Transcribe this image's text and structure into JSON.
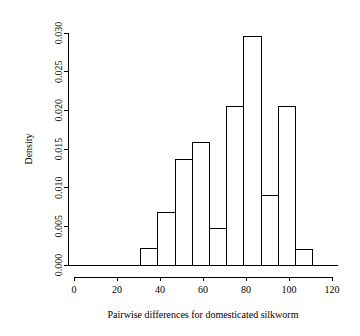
{
  "chart_data": {
    "type": "bar",
    "subtype": "histogram",
    "title": "",
    "xlabel": "Pairwise differences for domesticated silkworm",
    "ylabel": "Density",
    "xlim": [
      0,
      120
    ],
    "ylim": [
      0.0,
      0.03
    ],
    "grid": false,
    "legend": null,
    "bin_width": 8,
    "bin_edges": [
      31,
      39,
      47,
      55,
      63,
      71,
      79,
      87,
      95,
      103,
      111
    ],
    "categories": [
      "31-39",
      "39-47",
      "47-55",
      "55-63",
      "63-71",
      "71-79",
      "79-87",
      "87-95",
      "95-103",
      "103-111"
    ],
    "values": [
      0.0021,
      0.0068,
      0.0136,
      0.0159,
      0.0047,
      0.0205,
      0.0296,
      0.009,
      0.0205,
      0.002
    ],
    "bars": [
      {
        "x0": 31,
        "x1": 39,
        "density": 0.0021
      },
      {
        "x0": 39,
        "x1": 47,
        "density": 0.0068
      },
      {
        "x0": 47,
        "x1": 55,
        "density": 0.0136
      },
      {
        "x0": 55,
        "x1": 63,
        "density": 0.0159
      },
      {
        "x0": 63,
        "x1": 71,
        "density": 0.0047
      },
      {
        "x0": 71,
        "x1": 79,
        "density": 0.0205
      },
      {
        "x0": 79,
        "x1": 87,
        "density": 0.0296
      },
      {
        "x0": 87,
        "x1": 95,
        "density": 0.009
      },
      {
        "x0": 95,
        "x1": 103,
        "density": 0.0205
      },
      {
        "x0": 103,
        "x1": 111,
        "density": 0.002
      }
    ],
    "xticks": [
      0,
      20,
      40,
      60,
      80,
      100,
      120
    ],
    "xticklabels": [
      "0",
      "20",
      "40",
      "60",
      "80",
      "100",
      "120"
    ],
    "yticks": [
      0.0,
      0.005,
      0.01,
      0.015,
      0.02,
      0.025,
      0.03
    ],
    "yticklabels": [
      "0.000",
      "0.005",
      "0.010",
      "0.015",
      "0.020",
      "0.025",
      "0.030"
    ],
    "colors": {
      "axis": "#000000",
      "bar_stroke": "#000000",
      "bar_fill": "none",
      "background": "#ffffff",
      "text": "#000000"
    }
  }
}
